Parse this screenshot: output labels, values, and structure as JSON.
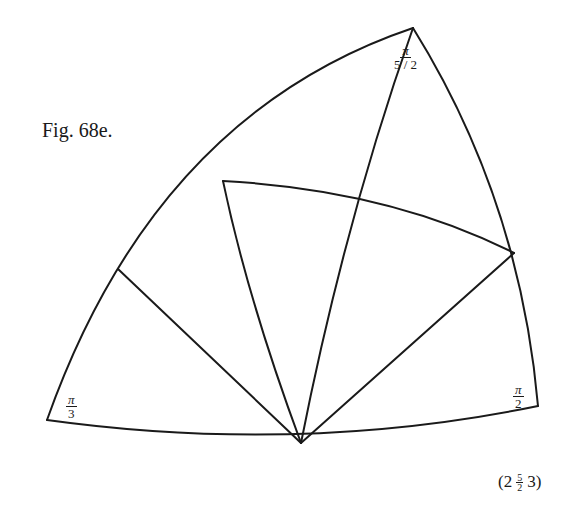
{
  "figure": {
    "caption": "Fig. 68e.",
    "stroke_color": "#1a1a1a",
    "background": "#ffffff"
  },
  "angle_labels": {
    "top": {
      "numerator": "π",
      "denominator": "5 / 2"
    },
    "bottom_left": {
      "numerator": "π",
      "denominator": "3"
    },
    "bottom_right": {
      "numerator": "π",
      "denominator": "2"
    }
  },
  "schlafli_symbol": {
    "open": "(2",
    "frac_num": "5",
    "frac_den": "2",
    "close": "3)"
  },
  "vertices": {
    "top": [
      413,
      28
    ],
    "bottom_left": [
      47,
      420
    ],
    "bottom_right": [
      538,
      406
    ],
    "bottom_mid": [
      301,
      443
    ],
    "left_mid": [
      118,
      269
    ],
    "upper_left": [
      223,
      181
    ],
    "right_mid": [
      514,
      253
    ]
  }
}
